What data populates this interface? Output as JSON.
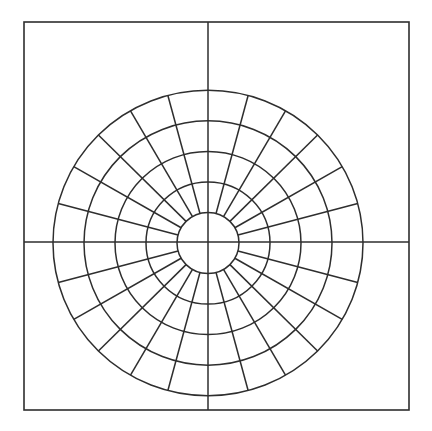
{
  "diagram": {
    "type": "polar-grid",
    "canvas": {
      "width": 432,
      "height": 431,
      "background": "#ffffff"
    },
    "line_color": "#2e2e2e",
    "frame": {
      "x": 24,
      "y": 22,
      "width": 385,
      "height": 388
    },
    "axes": {
      "vertical_x": 208,
      "horizontal_y": 242
    },
    "center": {
      "x": 208,
      "y": 243
    },
    "vertical_scale": 0.985,
    "rings": [
      31,
      62,
      93,
      124,
      155
    ],
    "spokes": {
      "count": 24,
      "angle_step_deg": 15,
      "inner_radius": 31,
      "outer_radius": 155
    }
  }
}
